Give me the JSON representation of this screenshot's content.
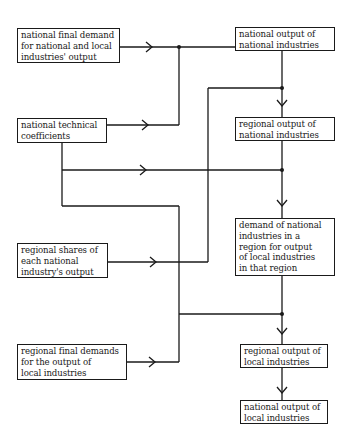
{
  "diagram": {
    "type": "flowchart",
    "left_inputs": [
      {
        "id": "nfd",
        "lines": [
          "national final demand",
          "for national and local",
          "industries' output"
        ]
      },
      {
        "id": "ntc",
        "lines": [
          "national technical",
          "coefficients"
        ]
      },
      {
        "id": "rs",
        "lines": [
          "regional shares of",
          "each national",
          "industry's output"
        ]
      },
      {
        "id": "rfd",
        "lines": [
          "regional final demands",
          "for the output of",
          "local industries"
        ]
      }
    ],
    "right_chain": [
      {
        "id": "nonat",
        "lines": [
          "national output of",
          "national industries"
        ]
      },
      {
        "id": "ronat",
        "lines": [
          "regional output of",
          "national industries"
        ]
      },
      {
        "id": "dem",
        "lines": [
          "demand of national",
          "industries in a",
          "region for output",
          "of local industries",
          "in that region"
        ]
      },
      {
        "id": "roloc",
        "lines": [
          "regional output of",
          "local industries"
        ]
      },
      {
        "id": "noloc",
        "lines": [
          "national output of",
          "local industries"
        ]
      }
    ],
    "edges": [
      {
        "from": "national final demand for national and local industries' output",
        "to": "national output of national industries"
      },
      {
        "from": "national technical coefficients",
        "to": "national output of national industries"
      },
      {
        "from": "national output of national industries",
        "to": "regional output of national industries"
      },
      {
        "from": "regional shares of each national industry's output",
        "to": "regional output of national industries"
      },
      {
        "from": "regional output of national industries",
        "to": "demand of national industries in a region for output of local industries in that region"
      },
      {
        "from": "national technical coefficients",
        "to": "demand of national industries in a region for output of local industries in that region"
      },
      {
        "from": "demand of national industries in a region for output of local industries in that region",
        "to": "regional output of local industries"
      },
      {
        "from": "national technical coefficients",
        "to": "regional output of local industries"
      },
      {
        "from": "regional final demands for the output of local industries",
        "to": "regional output of local industries"
      },
      {
        "from": "regional output of local industries",
        "to": "national output of local industries"
      }
    ]
  }
}
